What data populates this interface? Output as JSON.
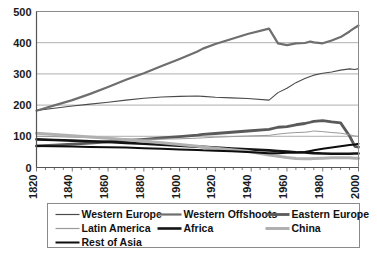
{
  "chart_data": {
    "type": "line",
    "title": "",
    "subtitle": "",
    "xlabel": "",
    "ylabel": "",
    "xlim": [
      1820,
      2000
    ],
    "ylim": [
      0,
      500
    ],
    "xticks": [
      1820,
      1840,
      1860,
      1880,
      1900,
      1920,
      1940,
      1960,
      1980,
      2000
    ],
    "yticks": [
      0,
      100,
      200,
      300,
      400,
      500
    ],
    "grid": "horizontal",
    "legend_position": "bottom",
    "x": [
      1820,
      1830,
      1840,
      1850,
      1860,
      1870,
      1880,
      1890,
      1900,
      1910,
      1913,
      1920,
      1929,
      1938,
      1950,
      1955,
      1960,
      1965,
      1970,
      1973,
      1975,
      1980,
      1985,
      1990,
      1995,
      1998,
      2000
    ],
    "series": [
      {
        "name": "Western Europe",
        "color": "#4a4a4a",
        "width": 1.1,
        "values": [
          183,
          190,
          197,
          203,
          209,
          216,
          222,
          226,
          228,
          229,
          228,
          225,
          223,
          221,
          216,
          240,
          254,
          272,
          285,
          292,
          296,
          302,
          306,
          312,
          316,
          314,
          317
        ]
      },
      {
        "name": "Western Offshoots",
        "color": "#6e6e6e",
        "width": 2.2,
        "values": [
          182,
          199,
          216,
          236,
          258,
          281,
          302,
          325,
          348,
          372,
          381,
          396,
          412,
          428,
          445,
          398,
          392,
          398,
          399,
          404,
          401,
          398,
          407,
          418,
          436,
          448,
          455
        ]
      },
      {
        "name": "Eastern Europe",
        "color": "#5a5a5a",
        "width": 2.8,
        "values": [
          69,
          72,
          75,
          78,
          82,
          86,
          90,
          95,
          99,
          104,
          106,
          109,
          113,
          117,
          122,
          129,
          131,
          137,
          141,
          145,
          148,
          150,
          146,
          143,
          101,
          68,
          65
        ]
      },
      {
        "name": "Latin America",
        "color": "#9a9a9a",
        "width": 1.0,
        "values": [
          100,
          99,
          97,
          96,
          94,
          92,
          90,
          91,
          92,
          94,
          95,
          97,
          99,
          101,
          103,
          107,
          110,
          112,
          113,
          115,
          117,
          115,
          112,
          110,
          105,
          101,
          100
        ]
      },
      {
        "name": "Africa",
        "color": "#141414",
        "width": 2.6,
        "values": [
          90,
          88,
          86,
          84,
          82,
          79,
          76,
          73,
          70,
          67,
          66,
          64,
          61,
          58,
          55,
          53,
          51,
          49,
          48,
          47,
          46,
          45,
          44,
          44,
          44,
          45,
          45
        ]
      },
      {
        "name": "China",
        "color": "#b0b0b0",
        "width": 3.0,
        "values": [
          110,
          106,
          102,
          98,
          94,
          89,
          84,
          79,
          74,
          68,
          66,
          62,
          57,
          52,
          40,
          36,
          32,
          29,
          28,
          28,
          29,
          30,
          31,
          31,
          31,
          30,
          30
        ]
      },
      {
        "name": "Rest of Asia",
        "color": "#0d0d0d",
        "width": 2.0,
        "values": [
          69,
          68,
          67,
          66,
          65,
          64,
          62,
          60,
          58,
          56,
          55,
          54,
          52,
          50,
          46,
          46,
          47,
          48,
          50,
          53,
          55,
          60,
          64,
          68,
          72,
          74,
          76
        ]
      }
    ]
  },
  "legend": {
    "items": [
      {
        "label": "Western Europe"
      },
      {
        "label": "Western Offshoots"
      },
      {
        "label": "Eastern Europe"
      },
      {
        "label": "Latin America"
      },
      {
        "label": "Africa"
      },
      {
        "label": "China"
      },
      {
        "label": "Rest of Asia"
      }
    ]
  },
  "colors": {
    "plot_border": "#8a8a8a",
    "gridline": "#9a9a9a",
    "axis": "#555555",
    "text": "#1a1a1a",
    "background": "#ffffff"
  }
}
